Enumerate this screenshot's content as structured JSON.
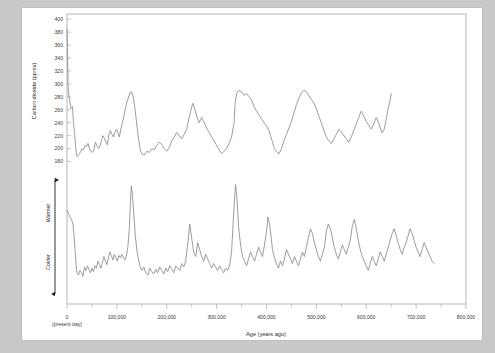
{
  "figure": {
    "background_color": "#c9c9c9",
    "card_color": "#ffffff"
  },
  "chart_data": {
    "type": "line",
    "title": "",
    "xlabel": "Age (years ago)",
    "xlabel_origin_note": "(present day)",
    "xlim": [
      0,
      800000
    ],
    "xticks": [
      0,
      100000,
      200000,
      300000,
      400000,
      500000,
      600000,
      700000,
      800000
    ],
    "xticklabels": [
      "0",
      "100,000",
      "200,000",
      "300,000",
      "400,000",
      "500,000",
      "600,000",
      "700,000",
      "800,000"
    ],
    "xminor_step": 50000,
    "grid": false,
    "legend": "none",
    "line_color": "#8a8a8a",
    "panels": [
      {
        "name": "carbon-dioxide-panel",
        "ylabel": "Carbon dioxide (ppmv)",
        "ylim": [
          170,
          408
        ],
        "yticks": [
          180,
          200,
          220,
          240,
          260,
          280,
          300,
          320,
          340,
          360,
          380,
          400
        ],
        "yticklabels": [
          "180",
          "200",
          "220",
          "240",
          "260",
          "280",
          "300",
          "320",
          "340",
          "360",
          "380",
          "400"
        ],
        "series": [
          {
            "name": "Atmospheric CO2 (ice core + modern)",
            "x": [
              0,
              1200,
              2000,
              3000,
              5000,
              8000,
              11000,
              13000,
              15000,
              17000,
              19000,
              21000,
              23000,
              25000,
              28000,
              30000,
              33000,
              36000,
              39000,
              42000,
              45000,
              48000,
              51000,
              54000,
              57000,
              60000,
              63000,
              66000,
              69000,
              72000,
              75000,
              78000,
              81000,
              84000,
              87000,
              90000,
              93000,
              96000,
              99000,
              102000,
              105000,
              108000,
              111000,
              114000,
              117000,
              120000,
              123000,
              126000,
              129000,
              132000,
              135000,
              138000,
              141000,
              144000,
              147000,
              150000,
              155000,
              160000,
              165000,
              170000,
              175000,
              180000,
              185000,
              190000,
              195000,
              200000,
              205000,
              210000,
              215000,
              220000,
              225000,
              230000,
              235000,
              240000,
              244000,
              248000,
              252000,
              256000,
              260000,
              265000,
              270000,
              275000,
              280000,
              285000,
              290000,
              295000,
              300000,
              305000,
              310000,
              315000,
              320000,
              325000,
              330000,
              335000,
              337000,
              340000,
              345000,
              350000,
              355000,
              360000,
              365000,
              370000,
              375000,
              380000,
              385000,
              390000,
              395000,
              400000,
              405000,
              408000,
              412000,
              416000,
              420000,
              425000,
              430000,
              435000,
              440000,
              445000,
              450000,
              455000,
              460000,
              465000,
              470000,
              475000,
              480000,
              485000,
              490000,
              495000,
              500000,
              505000,
              510000,
              515000,
              520000,
              525000,
              530000,
              535000,
              540000,
              545000,
              550000,
              555000,
              560000,
              565000,
              570000,
              575000,
              580000,
              585000,
              590000,
              595000,
              600000,
              605000,
              610000,
              615000,
              620000,
              625000,
              628000,
              632000,
              636000,
              640000,
              644000,
              648000,
              650000
            ],
            "y": [
              385,
              340,
              300,
              285,
              277,
              262,
              265,
              240,
              225,
              205,
              190,
              188,
              190,
              192,
              196,
              200,
              198,
              205,
              203,
              208,
              200,
              196,
              194,
              198,
              210,
              205,
              200,
              203,
              212,
              220,
              216,
              210,
              206,
              222,
              228,
              222,
              218,
              225,
              230,
              225,
              218,
              230,
              240,
              250,
              262,
              272,
              278,
              285,
              288,
              282,
              270,
              250,
              230,
              212,
              198,
              192,
              190,
              196,
              194,
              200,
              198,
              205,
              210,
              206,
              200,
              196,
              202,
              212,
              218,
              225,
              220,
              215,
              222,
              230,
              245,
              258,
              270,
              262,
              250,
              240,
              248,
              240,
              232,
              225,
              218,
              212,
              205,
              198,
              192,
              196,
              200,
              208,
              218,
              240,
              270,
              285,
              290,
              288,
              282,
              285,
              280,
              275,
              265,
              258,
              252,
              246,
              240,
              235,
              228,
              220,
              210,
              200,
              195,
              192,
              200,
              212,
              222,
              232,
              242,
              255,
              268,
              278,
              286,
              290,
              288,
              282,
              276,
              270,
              262,
              250,
              240,
              228,
              218,
              212,
              208,
              215,
              222,
              230,
              226,
              220,
              215,
              210,
              218,
              228,
              238,
              248,
              258,
              250,
              242,
              236,
              230,
              238,
              248,
              240,
              232,
              224,
              230,
              245,
              262,
              275,
              285,
              275,
              255,
              230,
              205,
              195,
              192,
              190,
              188,
              192,
              190
            ]
          }
        ]
      },
      {
        "name": "temperature-panel",
        "ylabel_arrow_top": "Warmer",
        "ylabel_arrow_bottom": "Colder",
        "ylim": [
          0,
          100
        ],
        "yticks": [],
        "yticklabels": [],
        "series": [
          {
            "name": "Antarctic temperature proxy (deuterium)",
            "x": [
              0,
              2000,
              4000,
              6000,
              9000,
              12000,
              14000,
              16000,
              18000,
              20000,
              23000,
              26000,
              29000,
              32000,
              35000,
              38000,
              41000,
              44000,
              47000,
              50000,
              53000,
              56000,
              59000,
              62000,
              65000,
              68000,
              71000,
              74000,
              77000,
              80000,
              83000,
              86000,
              89000,
              92000,
              95000,
              98000,
              101000,
              104000,
              107000,
              110000,
              113000,
              116000,
              119000,
              122000,
              125000,
              127000,
              129000,
              131000,
              134000,
              137000,
              140000,
              143000,
              146000,
              150000,
              154000,
              158000,
              162000,
              166000,
              170000,
              174000,
              178000,
              182000,
              186000,
              190000,
              194000,
              198000,
              202000,
              206000,
              210000,
              214000,
              218000,
              222000,
              226000,
              230000,
              234000,
              238000,
              240000,
              243000,
              246000,
              250000,
              254000,
              258000,
              262000,
              266000,
              270000,
              274000,
              278000,
              282000,
              286000,
              290000,
              294000,
              298000,
              302000,
              306000,
              310000,
              314000,
              318000,
              322000,
              326000,
              330000,
              333000,
              336000,
              338000,
              341000,
              344000,
              348000,
              352000,
              356000,
              360000,
              364000,
              368000,
              372000,
              376000,
              380000,
              384000,
              388000,
              392000,
              396000,
              400000,
              403000,
              406000,
              409000,
              412000,
              416000,
              420000,
              424000,
              428000,
              432000,
              436000,
              440000,
              444000,
              448000,
              452000,
              456000,
              460000,
              464000,
              468000,
              472000,
              476000,
              480000,
              484000,
              488000,
              492000,
              496000,
              500000,
              504000,
              508000,
              512000,
              516000,
              520000,
              524000,
              528000,
              532000,
              536000,
              540000,
              544000,
              548000,
              552000,
              556000,
              560000,
              564000,
              568000,
              572000,
              576000,
              580000,
              584000,
              588000,
              592000,
              596000,
              600000,
              604000,
              608000,
              612000,
              616000,
              620000,
              624000,
              628000,
              632000,
              636000,
              640000,
              644000,
              648000,
              652000,
              656000,
              660000,
              664000,
              668000,
              672000,
              676000,
              680000,
              684000,
              688000,
              692000,
              696000,
              700000,
              704000,
              708000,
              712000,
              716000,
              720000,
              724000,
              728000,
              732000,
              736000,
              740000
            ],
            "y": [
              74,
              72,
              70,
              68,
              66,
              62,
              52,
              40,
              28,
              20,
              18,
              22,
              20,
              17,
              25,
              22,
              26,
              23,
              20,
              24,
              21,
              26,
              24,
              30,
              27,
              24,
              29,
              34,
              30,
              27,
              33,
              38,
              35,
              31,
              36,
              33,
              30,
              35,
              33,
              36,
              33,
              31,
              35,
              42,
              58,
              80,
              95,
              88,
              70,
              52,
              40,
              32,
              26,
              22,
              25,
              20,
              18,
              24,
              21,
              19,
              23,
              20,
              25,
              22,
              19,
              24,
              21,
              26,
              23,
              20,
              26,
              24,
              22,
              28,
              25,
              30,
              38,
              48,
              62,
              50,
              38,
              34,
              46,
              40,
              34,
              30,
              36,
              32,
              28,
              24,
              28,
              25,
              22,
              26,
              23,
              20,
              24,
              22,
              26,
              38,
              62,
              85,
              96,
              82,
              60,
              44,
              34,
              30,
              26,
              32,
              38,
              34,
              30,
              36,
              42,
              38,
              34,
              44,
              56,
              68,
              62,
              52,
              40,
              33,
              28,
              24,
              30,
              26,
              32,
              40,
              36,
              32,
              28,
              34,
              30,
              26,
              32,
              38,
              34,
              42,
              50,
              58,
              54,
              46,
              40,
              34,
              30,
              36,
              42,
              56,
              62,
              58,
              50,
              42,
              36,
              32,
              38,
              44,
              40,
              36,
              42,
              48,
              60,
              66,
              58,
              48,
              40,
              34,
              30,
              26,
              22,
              28,
              34,
              30,
              26,
              32,
              38,
              34,
              30,
              36,
              42,
              48,
              54,
              58,
              52,
              46,
              40,
              36,
              42,
              46,
              52,
              58,
              54,
              48,
              42,
              38,
              34,
              40,
              46,
              42,
              38,
              34,
              30,
              28
            ]
          }
        ]
      }
    ]
  }
}
